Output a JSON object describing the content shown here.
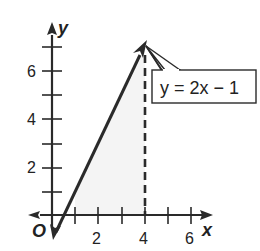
{
  "axes": {
    "x_label": "x",
    "y_label": "y",
    "origin_label": "O",
    "x_tick_labels": [
      "2",
      "4",
      "6"
    ],
    "y_tick_labels": [
      "2",
      "4",
      "6"
    ]
  },
  "line": {
    "equation": "y = 2x − 1",
    "slope": 2,
    "intercept": -1
  },
  "dashed_line": {
    "x": 4
  },
  "shaded_region": {
    "x_from": 1,
    "x_to": 4,
    "under": "y = 2x - 1"
  },
  "colors": {
    "line": "#2a2a2a",
    "shade": "#f3f3f3"
  }
}
